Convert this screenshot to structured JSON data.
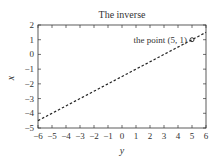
{
  "chart_data": {
    "type": "line",
    "title": "The inverse",
    "xlabel": "y",
    "ylabel": "x",
    "xlim": [
      -6,
      6
    ],
    "ylim": [
      -5,
      2
    ],
    "xticks": [
      -6,
      -5,
      -4,
      -3,
      -2,
      -1,
      0,
      1,
      2,
      3,
      4,
      5,
      6
    ],
    "yticks": [
      -5,
      -4,
      -3,
      -2,
      -1,
      0,
      1,
      2
    ],
    "grid": false,
    "series": [
      {
        "name": "inverse",
        "style": "dashed",
        "x": [
          -6,
          6
        ],
        "y": [
          -4.5,
          1.5
        ]
      }
    ],
    "points": [
      {
        "x": 5,
        "y": 1,
        "marker": "circle"
      }
    ],
    "annotations": [
      {
        "text": "the point (5, 1)",
        "x": 5,
        "y": 1
      }
    ]
  },
  "colors": {
    "line": "#222222",
    "frame": "#333333",
    "text": "#333333"
  }
}
